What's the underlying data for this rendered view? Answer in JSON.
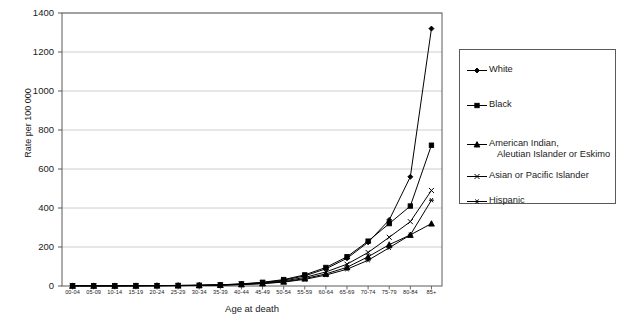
{
  "chart_data": {
    "type": "line",
    "title": "",
    "xlabel": "Age at death",
    "ylabel": "Rate per 100 000",
    "ylim": [
      0,
      1400
    ],
    "yticks": [
      0,
      200,
      400,
      600,
      800,
      1000,
      1200,
      1400
    ],
    "grid": true,
    "legend_position": "right-outside",
    "categories": [
      "00-04",
      "05-09",
      "10-14",
      "15-19",
      "20-24",
      "25-29",
      "30-34",
      "35-39",
      "40-44",
      "45-49",
      "50-54",
      "55-59",
      "60-64",
      "65-69",
      "70-74",
      "75-79",
      "80-84",
      "85+"
    ],
    "series": [
      {
        "name": "White",
        "marker": "diamond",
        "color": "#000000",
        "values": [
          1,
          1,
          1,
          2,
          2,
          3,
          4,
          6,
          10,
          17,
          30,
          52,
          88,
          142,
          224,
          339,
          560,
          1320
        ]
      },
      {
        "name": "Black",
        "marker": "square",
        "color": "#000000",
        "values": [
          1,
          1,
          1,
          2,
          2,
          3,
          4,
          6,
          11,
          19,
          33,
          57,
          95,
          150,
          230,
          320,
          410,
          722
        ]
      },
      {
        "name": "American Indian, Aleutian Islander or Eskimo",
        "marker": "triangle",
        "color": "#000000",
        "values": [
          1,
          1,
          1,
          1,
          2,
          2,
          3,
          5,
          8,
          13,
          22,
          38,
          62,
          96,
          150,
          212,
          262,
          320
        ]
      },
      {
        "name": "Asian or Pacific Islander",
        "marker": "cross",
        "color": "#000000",
        "values": [
          1,
          1,
          1,
          1,
          2,
          2,
          3,
          5,
          9,
          15,
          26,
          44,
          72,
          112,
          172,
          250,
          330,
          490
        ]
      },
      {
        "name": "Hispanic",
        "marker": "asterisk",
        "color": "#000000",
        "values": [
          1,
          1,
          1,
          1,
          1,
          2,
          3,
          4,
          7,
          12,
          20,
          34,
          56,
          86,
          132,
          196,
          262,
          440
        ]
      }
    ]
  },
  "axes": {
    "ylabel": "Rate per 100 000",
    "xlabel": "Age at death"
  },
  "legend": {
    "items": [
      {
        "label": "White",
        "label_line2": "",
        "marker": "diamond"
      },
      {
        "label": "Black",
        "label_line2": "",
        "marker": "square"
      },
      {
        "label": "American Indian,",
        "label_line2": "Aleutian Islander or Eskimo",
        "marker": "triangle"
      },
      {
        "label": "Asian or Pacific Islander",
        "label_line2": "",
        "marker": "cross"
      },
      {
        "label": "Hispanic",
        "label_line2": "",
        "marker": "asterisk"
      }
    ]
  },
  "style": {
    "axis_color": "#5a5a5a",
    "grid_color": "#c8c8c8",
    "series_color": "#000000",
    "text_color": "#1a1a1a"
  }
}
